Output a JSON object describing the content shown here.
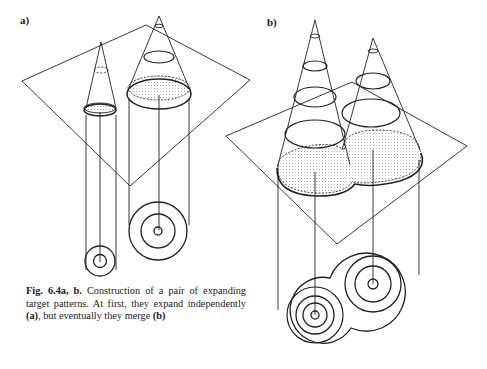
{
  "figure": {
    "panel_a_label": "a)",
    "panel_b_label": "b)",
    "caption": {
      "prefix": "Fig. 6.4a, b.",
      "text_1": " Construction of a pair of expanding target patterns. At first, they expand independently ",
      "ref_a": "(a)",
      "text_2": ", but eventually they merge ",
      "ref_b": "(b)"
    }
  }
}
